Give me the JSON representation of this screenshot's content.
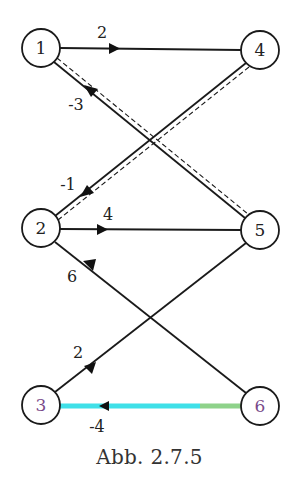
{
  "figure": {
    "caption": "Abb. 2.7.5",
    "nodes": [
      {
        "id": "1",
        "label": "1",
        "x": 41,
        "y": 48
      },
      {
        "id": "4",
        "label": "4",
        "x": 260,
        "y": 50
      },
      {
        "id": "2",
        "label": "2",
        "x": 41,
        "y": 228
      },
      {
        "id": "5",
        "label": "5",
        "x": 260,
        "y": 230
      },
      {
        "id": "3",
        "label": "3",
        "x": 41,
        "y": 405
      },
      {
        "id": "6",
        "label": "6",
        "x": 260,
        "y": 406
      }
    ],
    "edges": [
      {
        "from": "1",
        "to": "4",
        "weight": "2",
        "style": "solid"
      },
      {
        "from": "5",
        "to": "1",
        "weight": "-3",
        "style": "double-dashed"
      },
      {
        "from": "4",
        "to": "2",
        "weight": "-1",
        "style": "double-dashed"
      },
      {
        "from": "2",
        "to": "5",
        "weight": "4",
        "style": "solid"
      },
      {
        "from": "2",
        "to": "6",
        "weight": "6",
        "style": "solid"
      },
      {
        "from": "3",
        "to": "5",
        "weight": "2",
        "style": "solid"
      },
      {
        "from": "6",
        "to": "3",
        "weight": "-4",
        "style": "highlighted"
      }
    ],
    "colors": {
      "line": "#1a1a1a",
      "highlight": "#3fe0e8",
      "highlight_tail": "#8ed28a",
      "background": "#ffffff"
    }
  }
}
